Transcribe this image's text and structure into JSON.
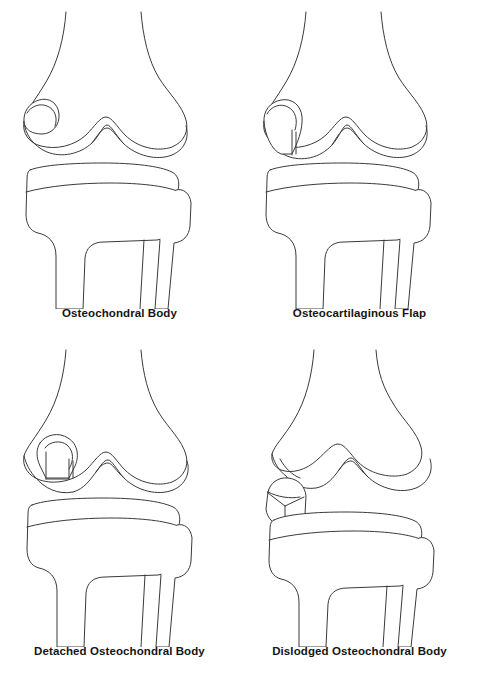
{
  "figure": {
    "background_color": "#ffffff",
    "line_color": "#3a3a3a",
    "caption_color": "#151515",
    "columns": 2,
    "rows": 2
  },
  "panels": [
    {
      "id": "osteochondral-body",
      "caption": "Osteochondral Body",
      "position": {
        "row": 0,
        "column": 0
      },
      "lesion": {
        "name": "osteochondral-body-in-situ",
        "description": "Oval osteochondral body still seated within the medial femoral condyle, no separation line",
        "location": "medial femoral condyle",
        "detached": "no",
        "displaced": "no"
      },
      "anatomy": [
        "femur",
        "medial femoral condyle",
        "lateral femoral condyle",
        "intercondylar notch",
        "tibia",
        "tibial plateau",
        "fibula"
      ]
    },
    {
      "id": "osteocartilaginous-flap",
      "caption": "Osteocartilaginous Flap",
      "position": {
        "row": 0,
        "column": 1
      },
      "lesion": {
        "name": "osteocartilaginous-flap",
        "description": "Osteochondral fragment hinged at one edge with a vertical cleft on the opposite side forming a flap",
        "location": "medial femoral condyle",
        "detached": "partial",
        "displaced": "no"
      },
      "anatomy": [
        "femur",
        "medial femoral condyle",
        "lateral femoral condyle",
        "intercondylar notch",
        "tibia",
        "tibial plateau",
        "fibula"
      ]
    },
    {
      "id": "detached-osteochondral-body",
      "caption": "Detached Osteochondral Body",
      "position": {
        "row": 1,
        "column": 0
      },
      "lesion": {
        "name": "detached-osteochondral-body",
        "description": "Fragment fully separated from the condyle by clefts on both sides but still resting in its crater",
        "location": "medial femoral condyle",
        "detached": "yes",
        "displaced": "no"
      },
      "anatomy": [
        "femur",
        "medial femoral condyle",
        "lateral femoral condyle",
        "intercondylar notch",
        "tibia",
        "tibial plateau",
        "fibula"
      ]
    },
    {
      "id": "dislodged-osteochondral-body",
      "caption": "Dislodged Osteochondral Body",
      "position": {
        "row": 1,
        "column": 1
      },
      "lesion": {
        "name": "dislodged-osteochondral-body",
        "description": "Free polyhedral loose body displaced out of the empty condylar crater into the joint space",
        "location": "joint space adjacent to medial femoral condyle",
        "detached": "yes",
        "displaced": "yes"
      },
      "anatomy": [
        "femur",
        "medial femoral condyle",
        "lateral femoral condyle",
        "intercondylar notch",
        "empty crater",
        "tibia",
        "tibial plateau",
        "fibula"
      ]
    }
  ]
}
